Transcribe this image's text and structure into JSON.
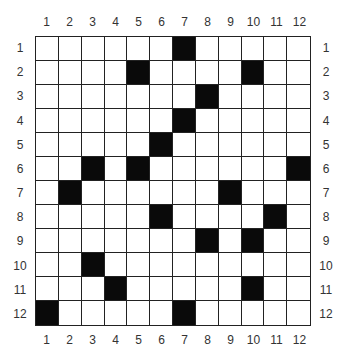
{
  "grid": {
    "rows": 12,
    "cols": 12,
    "column_labels": [
      "1",
      "2",
      "3",
      "4",
      "5",
      "6",
      "7",
      "8",
      "9",
      "10",
      "11",
      "12"
    ],
    "row_labels": [
      "1",
      "2",
      "3",
      "4",
      "5",
      "6",
      "7",
      "8",
      "9",
      "10",
      "11",
      "12"
    ],
    "black_cells": [
      [
        1,
        7
      ],
      [
        2,
        5
      ],
      [
        2,
        10
      ],
      [
        3,
        8
      ],
      [
        4,
        7
      ],
      [
        5,
        6
      ],
      [
        6,
        3
      ],
      [
        6,
        5
      ],
      [
        6,
        12
      ],
      [
        7,
        2
      ],
      [
        7,
        9
      ],
      [
        8,
        6
      ],
      [
        8,
        11
      ],
      [
        9,
        8
      ],
      [
        9,
        10
      ],
      [
        10,
        3
      ],
      [
        11,
        4
      ],
      [
        11,
        10
      ],
      [
        12,
        1
      ],
      [
        12,
        7
      ]
    ],
    "colors": {
      "filled": "#0a0a0a",
      "empty": "#ffffff",
      "line": "#222222"
    }
  }
}
